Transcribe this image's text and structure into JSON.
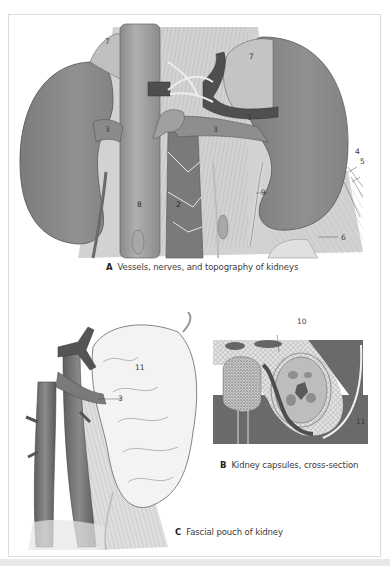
{
  "figure": {
    "panels": [
      {
        "id": "A",
        "letter": "A",
        "caption": "Vessels, nerves, and topography of kidneys",
        "labels": [
          "7",
          "7",
          "3",
          "3",
          "1",
          "4",
          "5",
          "6",
          "8",
          "2",
          "9"
        ]
      },
      {
        "id": "B",
        "letter": "B",
        "caption": "Kidney capsules, cross-section",
        "labels": [
          "10",
          "11"
        ]
      },
      {
        "id": "C",
        "letter": "C",
        "caption": "Fascial pouch of kidney",
        "labels": [
          "11",
          "3"
        ]
      }
    ],
    "colors": {
      "kidney": "#8c8c8c",
      "vessel_dark": "#5a5a5a",
      "muscle": "#c8c8c8",
      "fat": "#e8e8e8",
      "frame_border": "#dcdcdc",
      "strip": "#e8e8e8"
    }
  }
}
